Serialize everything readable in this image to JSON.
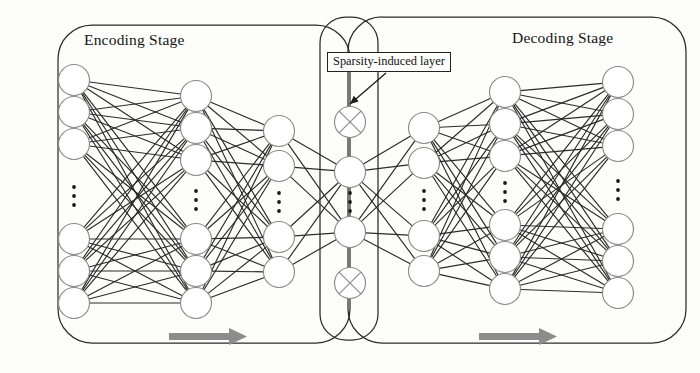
{
  "figure": {
    "type": "diagram",
    "background_color": "#fdfdfb",
    "stroke_color": "#2b2b2b",
    "node_stroke_color": "#8a8a8a",
    "arrow_color": "#8c8c8c"
  },
  "containers": [
    {
      "name": "encoding-stage",
      "title": "Encoding Stage",
      "x": 58,
      "y": 25,
      "w": 292,
      "h": 318,
      "radius": 34
    },
    {
      "name": "sparsity-stage",
      "title": "",
      "x": 320,
      "y": 17,
      "w": 58,
      "h": 323,
      "radius": 26
    },
    {
      "name": "decoding-stage",
      "title": "Decoding Stage",
      "x": 348,
      "y": 17,
      "w": 338,
      "h": 326,
      "radius": 34
    }
  ],
  "callout": {
    "label": "Sparsity-induced layer",
    "box": {
      "x": 327,
      "y": 52,
      "w": 131,
      "h": 20
    },
    "arrow": {
      "x1": 386,
      "y1": 73,
      "x2": 350,
      "y2": 104
    }
  },
  "flow_arrows": [
    {
      "name": "encoding-flow-arrow",
      "x": 169,
      "y": 331,
      "w": 78,
      "h": 11,
      "direction": "right",
      "color": "#8c8c8c"
    },
    {
      "name": "decoding-flow-arrow",
      "x": 479,
      "y": 331,
      "w": 78,
      "h": 11,
      "direction": "right",
      "color": "#8c8c8c"
    }
  ],
  "layers": [
    {
      "name": "input-layer",
      "role": "input",
      "x": 74,
      "radius": 15.5,
      "top_nodes": [
        80,
        112,
        144
      ],
      "bottom_nodes": [
        239,
        271,
        303
      ],
      "ellipsis_y": 196,
      "node_type": "plain",
      "count_label": "6 visible"
    },
    {
      "name": "encoder-hidden-1",
      "role": "hidden",
      "x": 196,
      "radius": 15.5,
      "top_nodes": [
        96,
        128,
        160
      ],
      "bottom_nodes": [
        239,
        271,
        303
      ],
      "ellipsis_y": 200,
      "node_type": "plain",
      "count_label": "6 visible"
    },
    {
      "name": "encoder-hidden-2",
      "role": "hidden",
      "x": 279,
      "radius": 15.5,
      "top_nodes": [
        131,
        166
      ],
      "bottom_nodes": [
        237,
        272
      ],
      "ellipsis_y": 202,
      "node_type": "plain",
      "count_label": "4 visible"
    },
    {
      "name": "sparsity-induced-layer",
      "role": "bottleneck",
      "x": 350,
      "radius": 15.5,
      "top_nodes": [
        122,
        172
      ],
      "bottom_nodes": [
        232,
        283
      ],
      "ellipsis_y": 202,
      "node_type": "mixed",
      "crossed_nodes": [
        122,
        283
      ],
      "count_label": "4 visible, 2 pruned"
    },
    {
      "name": "decoder-hidden-1",
      "role": "hidden",
      "x": 424,
      "radius": 15.5,
      "top_nodes": [
        128,
        163
      ],
      "bottom_nodes": [
        236,
        271
      ],
      "ellipsis_y": 200,
      "node_type": "plain",
      "count_label": "4 visible"
    },
    {
      "name": "decoder-hidden-2",
      "role": "hidden",
      "x": 505,
      "radius": 15.5,
      "top_nodes": [
        92,
        124,
        156
      ],
      "bottom_nodes": [
        225,
        257,
        289
      ],
      "ellipsis_y": 192,
      "node_type": "plain",
      "count_label": "6 visible"
    },
    {
      "name": "output-layer",
      "role": "output",
      "x": 618,
      "radius": 15.5,
      "top_nodes": [
        82,
        114,
        146
      ],
      "bottom_nodes": [
        229,
        261,
        293
      ],
      "ellipsis_y": 190,
      "node_type": "plain",
      "count_label": "6 visible"
    }
  ],
  "connections": [
    {
      "from": "input-layer",
      "to": "encoder-hidden-1",
      "style": "dense-fully-connected"
    },
    {
      "from": "encoder-hidden-1",
      "to": "encoder-hidden-2",
      "style": "dense-fully-connected"
    },
    {
      "from": "encoder-hidden-2",
      "to": "sparsity-induced-layer",
      "style": "sparse-skips-crossed"
    },
    {
      "from": "sparsity-induced-layer",
      "to": "decoder-hidden-1",
      "style": "sparse-skips-crossed"
    },
    {
      "from": "decoder-hidden-1",
      "to": "decoder-hidden-2",
      "style": "dense-fully-connected"
    },
    {
      "from": "decoder-hidden-2",
      "to": "output-layer",
      "style": "dense-fully-connected"
    }
  ]
}
